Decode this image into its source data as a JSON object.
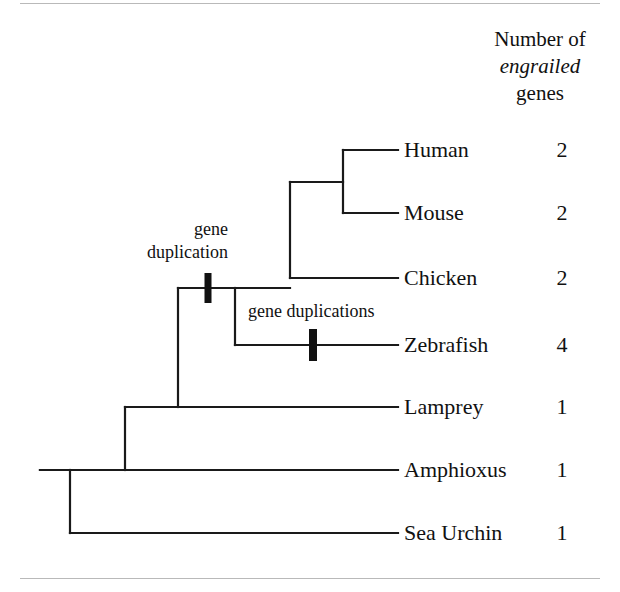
{
  "figure": {
    "title_block": {
      "line1": "Number of",
      "line2": "engrailed",
      "line3": "genes"
    },
    "geometry": {
      "width": 620,
      "height": 592,
      "label_x": 404,
      "count_x": 542,
      "tip_x": 398
    },
    "tips": [
      {
        "name": "Human",
        "count": "2",
        "y": 150,
        "branch_from_x": 343
      },
      {
        "name": "Mouse",
        "count": "2",
        "y": 213,
        "branch_from_x": 343
      },
      {
        "name": "Chicken",
        "count": "2",
        "y": 278,
        "branch_from_x": 290
      },
      {
        "name": "Zebrafish",
        "count": "4",
        "y": 345,
        "branch_from_x": 235
      },
      {
        "name": "Lamprey",
        "count": "1",
        "y": 407,
        "branch_from_x": 178
      },
      {
        "name": "Amphioxus",
        "count": "1",
        "y": 470,
        "branch_from_x": 125
      },
      {
        "name": "Sea Urchin",
        "count": "1",
        "y": 533,
        "branch_from_x": 70
      }
    ],
    "nodes": [
      {
        "id": "human-mouse",
        "x": 343,
        "y_top": 150,
        "y_bottom": 213,
        "parent_x": 290,
        "parent_y": 182
      },
      {
        "id": "amniote",
        "x": 290,
        "y_top": 182,
        "y_bottom": 278,
        "parent_x": 235,
        "parent_y": 288
      },
      {
        "id": "vertebrate",
        "x": 235,
        "y_top": 288,
        "y_bottom": 345,
        "parent_x": 178,
        "parent_y": 288
      },
      {
        "id": "craniate",
        "x": 178,
        "y_top": 288,
        "y_bottom": 407,
        "parent_x": 125,
        "parent_y": 407
      },
      {
        "id": "chordate",
        "x": 125,
        "y_top": 407,
        "y_bottom": 470,
        "parent_x": 70,
        "parent_y": 470
      },
      {
        "id": "deuterostome",
        "x": 70,
        "y_top": 470,
        "y_bottom": 533,
        "parent_x": 40,
        "parent_y": 470
      }
    ],
    "root_stem": {
      "x1": 40,
      "x2": 70,
      "y": 470
    },
    "events": [
      {
        "id": "gene-duplication-vertebrate",
        "label_lines": [
          "gene",
          "duplication"
        ],
        "label_x": 228,
        "label_y": 218,
        "label_align": "right",
        "tick_x": 208,
        "tick_y": 288,
        "tick_w": 7,
        "tick_h": 30
      },
      {
        "id": "gene-duplications-zebrafish",
        "label_lines": [
          "gene duplications"
        ],
        "label_x": 248,
        "label_y": 300,
        "label_align": "left",
        "tick_x": 313,
        "tick_y": 345,
        "tick_w": 8,
        "tick_h": 32
      }
    ],
    "colors": {
      "branch": "#1a1a1a",
      "rule": "#b9b9b9",
      "text": "#111111",
      "background": "#ffffff"
    }
  }
}
